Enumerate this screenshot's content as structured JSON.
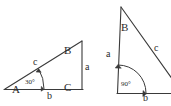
{
  "figure": {
    "background_color": "#ffffff",
    "stroke_color": "#3a3a3a",
    "text_color": "#2b2b2b",
    "width": 171,
    "height": 106
  },
  "triangle_left": {
    "name": "triangle-ABC-30-degrees",
    "vertices": {
      "A": {
        "label": "A",
        "x": 16,
        "y": 91
      },
      "B": {
        "label": "B",
        "x": 70,
        "y": 52
      },
      "C": {
        "label": "C",
        "x": 70,
        "y": 91
      }
    },
    "sides": {
      "hypotenuse": {
        "label": "c",
        "x": 36,
        "y": 64
      },
      "vertical": {
        "label": "a",
        "x": 86,
        "y": 69
      },
      "base": {
        "label": "b",
        "x": 50,
        "y": 98
      }
    },
    "angle": {
      "label": "30°",
      "value": 30,
      "unit": "degrees",
      "x": 27,
      "y": 84
    }
  },
  "triangle_right": {
    "name": "triangle-right-angle-90-degrees",
    "vertices": {
      "B": {
        "label": "B",
        "x": 124,
        "y": 29
      }
    },
    "sides": {
      "vertical": {
        "label": "a",
        "x": 109,
        "y": 56
      },
      "hypotenuse": {
        "label": "c",
        "x": 157,
        "y": 50
      },
      "base": {
        "label": "b",
        "x": 146,
        "y": 99
      }
    },
    "angle": {
      "label": "90°",
      "value": 90,
      "unit": "degrees",
      "x": 125,
      "y": 86
    }
  }
}
